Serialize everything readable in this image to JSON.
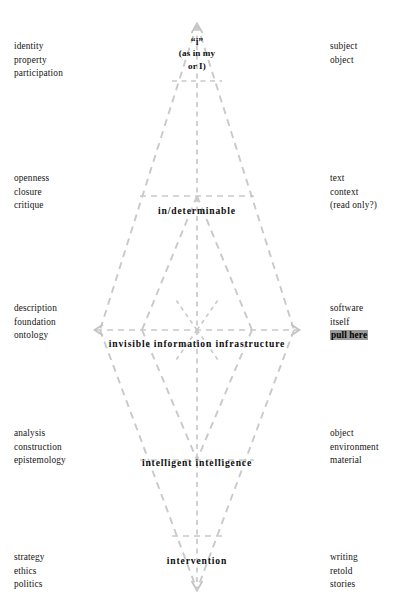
{
  "diagram": {
    "title_apex_top": {
      "quoted_i": "“i”",
      "line2": "(as in my",
      "line3": "or I)"
    },
    "tiers": [
      {
        "id": "identity",
        "left": [
          "identity",
          "property",
          "participation"
        ],
        "right": [
          "subject",
          "object"
        ],
        "center_label": ""
      },
      {
        "id": "indeterminable",
        "left": [
          "openness",
          "closure",
          "critique"
        ],
        "right": [
          "text",
          "context",
          "(read only?)"
        ],
        "center_label": "in/determinable"
      },
      {
        "id": "infrastructure",
        "left": [
          "description",
          "foundation",
          "ontology"
        ],
        "right": [
          "software",
          "itself",
          "pull here"
        ],
        "right_highlight_index": 2,
        "center_label": "invisible information infrastructure"
      },
      {
        "id": "intelligence",
        "left": [
          "analysis",
          "construction",
          "epistemology"
        ],
        "right": [
          "object",
          "environment",
          "material"
        ],
        "center_label": "intelligent intelligence"
      },
      {
        "id": "intervention",
        "left": [
          "strategy",
          "ethics",
          "politics"
        ],
        "right": [
          "writing",
          "retold",
          "stories"
        ],
        "center_label": "intervention"
      }
    ],
    "colors": {
      "line": "#c9c9c9",
      "text": "#141414",
      "highlight_bg": "#9a9a9a",
      "background": "#ffffff"
    }
  }
}
